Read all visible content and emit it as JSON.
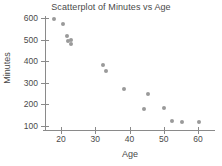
{
  "chart_data": {
    "type": "scatter",
    "title": "Scatterplot of Minutes vs Age",
    "xlabel": "Age",
    "ylabel": "Minutes",
    "xlim": [
      16,
      62
    ],
    "ylim": [
      85,
      615
    ],
    "xticks": [
      20,
      30,
      40,
      50,
      60
    ],
    "yticks": [
      100,
      200,
      300,
      400,
      500,
      600
    ],
    "grid": false,
    "legend": null,
    "point_color": "#9a9a9a",
    "axis_color": "#8a8a8a",
    "text_color": "#4a4a4a",
    "points": [
      {
        "x": 17.9,
        "y": 594
      },
      {
        "x": 20.5,
        "y": 572
      },
      {
        "x": 21.8,
        "y": 516
      },
      {
        "x": 21.9,
        "y": 494
      },
      {
        "x": 22.8,
        "y": 500
      },
      {
        "x": 23.0,
        "y": 478
      },
      {
        "x": 32.3,
        "y": 382
      },
      {
        "x": 33.2,
        "y": 355
      },
      {
        "x": 38.5,
        "y": 272
      },
      {
        "x": 44.2,
        "y": 178
      },
      {
        "x": 45.3,
        "y": 250
      },
      {
        "x": 50.2,
        "y": 183
      },
      {
        "x": 52.3,
        "y": 125
      },
      {
        "x": 55.4,
        "y": 118
      },
      {
        "x": 60.2,
        "y": 120
      }
    ]
  }
}
